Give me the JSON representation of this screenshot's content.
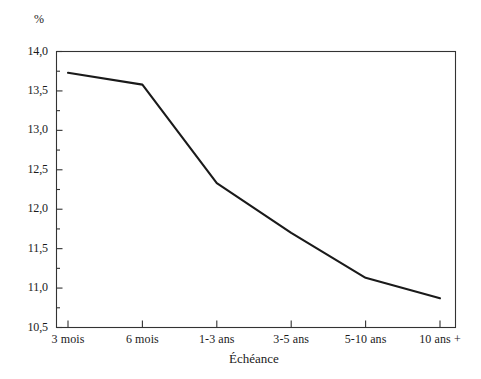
{
  "chart_data": {
    "type": "line",
    "title": "",
    "xlabel": "Échéance",
    "ylabel": "%",
    "categories": [
      "3 mois",
      "6 mois",
      "1-3 ans",
      "3-5 ans",
      "5-10 ans",
      "10 ans +"
    ],
    "values": [
      13.73,
      13.58,
      12.33,
      11.7,
      11.13,
      10.87
    ],
    "series": [
      {
        "name": "Taux",
        "values": [
          13.73,
          13.58,
          12.33,
          11.7,
          11.13,
          10.87
        ]
      }
    ],
    "ylim": [
      10.5,
      14.0
    ],
    "ytick_values": [
      14.0,
      13.5,
      13.0,
      12.5,
      12.0,
      11.5,
      11.0,
      10.5
    ],
    "ytick_labels": [
      "14,0",
      "13,5",
      "13,0",
      "12,5",
      "12,0",
      "11,5",
      "11,0",
      "10,5"
    ],
    "yminor_step": 0.25,
    "grid": false,
    "legend": "none",
    "line_color": "#1a1a1a",
    "axis_color": "#333333",
    "background_color": "#ffffff"
  }
}
